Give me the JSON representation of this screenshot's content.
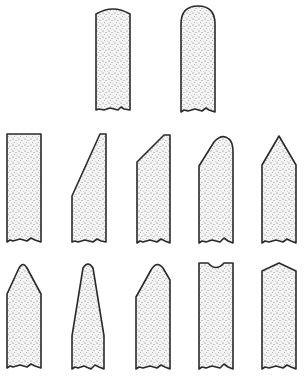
{
  "figure": {
    "colors": {
      "outline": "#2a2a2a",
      "stipple_dot": "#6b6b6b",
      "fill": "#f4f4f4",
      "background": "#ffffff"
    },
    "rows": [
      {
        "row": 1,
        "profiles": [
          {
            "id": "p1",
            "shape": "flat-top-slightly-rounded"
          },
          {
            "id": "p2",
            "shape": "full-round-top"
          }
        ]
      },
      {
        "row": 2,
        "profiles": [
          {
            "id": "p3",
            "shape": "square-flat"
          },
          {
            "id": "p4",
            "shape": "steep-bevel-left"
          },
          {
            "id": "p5",
            "shape": "45-degree-bevel-left"
          },
          {
            "id": "p6",
            "shape": "bevel-left-with-rounded-top"
          },
          {
            "id": "p7",
            "shape": "pointed-double-bevel"
          }
        ]
      },
      {
        "row": 3,
        "profiles": [
          {
            "id": "p8",
            "shape": "double-bevel-rounded-tip"
          },
          {
            "id": "p9",
            "shape": "tapered-narrow-rounded-tip"
          },
          {
            "id": "p10",
            "shape": "offset-bevel-rounded-tip"
          },
          {
            "id": "p11",
            "shape": "concave-top"
          },
          {
            "id": "p12",
            "shape": "shallow-double-bevel"
          }
        ]
      }
    ]
  }
}
